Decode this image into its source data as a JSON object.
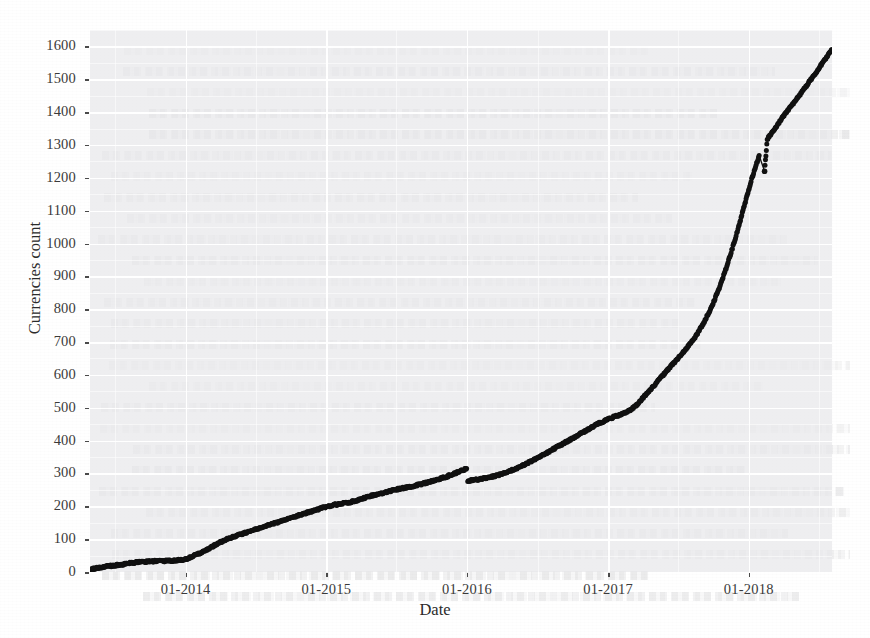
{
  "figure": {
    "background_color": "#ffffff",
    "panel_color": "#e8e8ea",
    "grid_color": "#ffffff",
    "point_color": "#111111"
  },
  "axes": {
    "y_title": "Currencies count",
    "x_title": "Date",
    "y_ticks": [
      "0",
      "100",
      "200",
      "300",
      "400",
      "500",
      "600",
      "700",
      "800",
      "900",
      "1000",
      "1100",
      "1200",
      "1300",
      "1400",
      "1500",
      "1600"
    ],
    "x_ticks": [
      "01-2014",
      "01-2015",
      "01-2016",
      "01-2017",
      "01-2018"
    ]
  },
  "chart_data": {
    "type": "scatter",
    "title": "",
    "subtitle": "",
    "xlabel": "Date",
    "ylabel": "Currencies count",
    "xlim": [
      "2013-04-28",
      "2018-08-05"
    ],
    "ylim": [
      0,
      1650
    ],
    "grid": true,
    "legend": "none",
    "x_tick_labels": [
      "01-2014",
      "01-2015",
      "01-2016",
      "01-2017",
      "01-2018"
    ],
    "x_tick_values": [
      "2014-01-01",
      "2015-01-01",
      "2016-01-01",
      "2017-01-01",
      "2018-01-01"
    ],
    "y_tick_values": [
      0,
      100,
      200,
      300,
      400,
      500,
      600,
      700,
      800,
      900,
      1000,
      1100,
      1200,
      1300,
      1400,
      1500,
      1600
    ],
    "annotations": [
      {
        "text": "discontinuity / downward step at 01-2016 (~315 -> ~278)",
        "x": "2016-01-03",
        "y": 300
      },
      {
        "text": "isolated low outlier near 02-2018 (~1220 vs ~1310 trend)",
        "x": "2018-02-11",
        "y": 1220
      }
    ],
    "series": [
      {
        "name": "Currencies count",
        "marker": "point",
        "color": "#111111",
        "x": [
          "2013-04-28",
          "2013-05-19",
          "2013-06-09",
          "2013-06-30",
          "2013-07-21",
          "2013-08-11",
          "2013-09-01",
          "2013-09-22",
          "2013-10-13",
          "2013-11-03",
          "2013-11-24",
          "2013-12-15",
          "2014-01-05",
          "2014-01-26",
          "2014-02-16",
          "2014-03-09",
          "2014-03-30",
          "2014-04-20",
          "2014-05-11",
          "2014-06-01",
          "2014-06-22",
          "2014-07-13",
          "2014-08-03",
          "2014-08-24",
          "2014-09-14",
          "2014-10-05",
          "2014-10-26",
          "2014-11-16",
          "2014-12-07",
          "2014-12-28",
          "2015-01-18",
          "2015-02-08",
          "2015-03-01",
          "2015-03-22",
          "2015-04-12",
          "2015-05-03",
          "2015-05-24",
          "2015-06-14",
          "2015-07-05",
          "2015-07-26",
          "2015-08-16",
          "2015-09-06",
          "2015-09-27",
          "2015-10-18",
          "2015-11-08",
          "2015-11-29",
          "2015-12-20",
          "2015-12-31",
          "2016-01-03",
          "2016-01-24",
          "2016-02-14",
          "2016-03-06",
          "2016-03-27",
          "2016-04-17",
          "2016-05-08",
          "2016-05-29",
          "2016-06-19",
          "2016-07-10",
          "2016-07-31",
          "2016-08-21",
          "2016-09-11",
          "2016-10-02",
          "2016-10-23",
          "2016-11-13",
          "2016-12-04",
          "2016-12-25",
          "2017-01-15",
          "2017-02-05",
          "2017-02-26",
          "2017-03-19",
          "2017-04-09",
          "2017-04-30",
          "2017-05-21",
          "2017-06-11",
          "2017-07-02",
          "2017-07-23",
          "2017-08-13",
          "2017-09-03",
          "2017-09-24",
          "2017-10-15",
          "2017-11-05",
          "2017-11-26",
          "2017-12-17",
          "2018-01-07",
          "2018-01-28",
          "2018-02-11",
          "2018-02-18",
          "2018-03-11",
          "2018-04-01",
          "2018-04-22",
          "2018-05-13",
          "2018-06-03",
          "2018-06-24",
          "2018-07-15",
          "2018-08-05"
        ],
        "y": [
          8,
          13,
          17,
          20,
          23,
          27,
          30,
          32,
          33,
          34,
          34,
          36,
          40,
          52,
          62,
          76,
          90,
          101,
          110,
          118,
          126,
          134,
          142,
          150,
          158,
          166,
          174,
          182,
          190,
          197,
          203,
          208,
          212,
          218,
          226,
          234,
          240,
          246,
          252,
          257,
          262,
          268,
          275,
          282,
          290,
          300,
          310,
          315,
          278,
          281,
          285,
          290,
          297,
          305,
          315,
          327,
          340,
          352,
          366,
          380,
          394,
          408,
          422,
          436,
          450,
          462,
          472,
          480,
          492,
          512,
          540,
          568,
          596,
          624,
          652,
          680,
          712,
          752,
          800,
          860,
          930,
          1010,
          1100,
          1190,
          1268,
          1220,
          1318,
          1352,
          1388,
          1420,
          1452,
          1486,
          1520,
          1556,
          1590
        ]
      }
    ]
  }
}
